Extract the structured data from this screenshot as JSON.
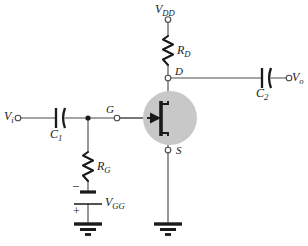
{
  "figure": {
    "background_color": "#ffffff",
    "line_color": "#4d4d4d",
    "ink_color": "#1a1a1a",
    "device_shade_color": "#c8c8c8"
  },
  "labels": {
    "v_in": {
      "main": "V",
      "sub": "i"
    },
    "v_out": {
      "main": "V",
      "sub": "o"
    },
    "v_dd": {
      "main": "V",
      "sub": "DD"
    },
    "v_gg": {
      "main": "V",
      "sub": "GG"
    },
    "c1": {
      "main": "C",
      "sub": "1"
    },
    "c2": {
      "main": "C",
      "sub": "2"
    },
    "r_d": {
      "main": "R",
      "sub": "D"
    },
    "r_g": {
      "main": "R",
      "sub": "G"
    },
    "node_gate": "G",
    "node_drain": "D",
    "node_source": "S",
    "battery_negative": "−",
    "battery_positive": "+"
  },
  "components": [
    {
      "id": "c1",
      "type": "capacitor",
      "label": "C1",
      "orientation": "horizontal"
    },
    {
      "id": "c2",
      "type": "capacitor",
      "label": "C2",
      "orientation": "horizontal"
    },
    {
      "id": "rd",
      "type": "resistor",
      "label": "RD",
      "orientation": "vertical"
    },
    {
      "id": "rg",
      "type": "resistor",
      "label": "RG",
      "orientation": "vertical"
    },
    {
      "id": "vgg",
      "type": "battery",
      "label": "VGG",
      "orientation": "vertical"
    },
    {
      "id": "jfet",
      "type": "n-channel-jfet",
      "terminals": [
        "G",
        "D",
        "S"
      ]
    },
    {
      "id": "gnd-gate",
      "type": "ground"
    },
    {
      "id": "gnd-source",
      "type": "ground"
    }
  ],
  "terminals": [
    {
      "id": "vi",
      "label": "Vi",
      "style": "open-circle"
    },
    {
      "id": "vo",
      "label": "Vo",
      "style": "open-circle"
    },
    {
      "id": "vdd",
      "label": "VDD",
      "style": "open-circle"
    },
    {
      "id": "gate",
      "label": "G",
      "style": "open-circle"
    },
    {
      "id": "drain",
      "label": "D",
      "style": "open-circle"
    },
    {
      "id": "source",
      "label": "S",
      "style": "open-circle"
    }
  ]
}
